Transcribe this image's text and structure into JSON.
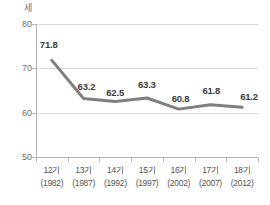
{
  "chart_data": {
    "type": "line",
    "title": "",
    "subtitle": "",
    "xlabel": "",
    "ylabel": "세",
    "unit_label": "세",
    "categories": [
      "12기",
      "13기",
      "14기",
      "15기",
      "16기",
      "17기",
      "18기"
    ],
    "category_sublabels": [
      "(1982)",
      "(1987)",
      "(1992)",
      "(1997)",
      "(2002)",
      "(2007)",
      "(2012)"
    ],
    "values": [
      71.8,
      63.2,
      62.5,
      63.3,
      60.8,
      61.8,
      61.2
    ],
    "value_labels": [
      "71.8",
      "63.2",
      "62.5",
      "63.3",
      "60.8",
      "61.8",
      "61.2"
    ],
    "ylim": [
      50,
      80
    ],
    "y_ticks": [
      80,
      70,
      60,
      50
    ],
    "y_tick_labels": [
      "80",
      "70",
      "60",
      "50"
    ],
    "grid": true,
    "legend": false,
    "legend_position": "none",
    "series": [
      {
        "name": "",
        "values": [
          71.8,
          63.2,
          62.5,
          63.3,
          60.8,
          61.8,
          61.2
        ]
      }
    ]
  },
  "colors": {
    "line": "#808080",
    "gridline": "#dcdcdc",
    "axis": "#b4b4b4",
    "tick_text": "#6e6e6e",
    "value_text": "#3c3c3c",
    "category_text": "#555555",
    "background": "#ffffff"
  }
}
